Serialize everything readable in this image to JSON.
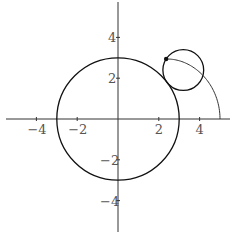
{
  "diagram": {
    "type": "epicycloid-construction",
    "fixed_circle": {
      "center": [
        0,
        0
      ],
      "radius": 3
    },
    "rolling_circle": {
      "center": [
        3.2,
        2.4
      ],
      "radius": 1
    },
    "tracing_point": [
      2.36,
      2.94
    ],
    "trace_start": [
      5,
      0
    ],
    "trace_param_end": 0.6435,
    "trace_equation": "x = 4cos(t) + cos(4t), y = 4sin(t) + sin(4t)"
  },
  "axes": {
    "x_ticks": [
      {
        "value": -4,
        "label": "-4"
      },
      {
        "value": -2,
        "label": "-2"
      },
      {
        "value": 2,
        "label": "2"
      },
      {
        "value": 4,
        "label": "4"
      }
    ],
    "y_ticks": [
      {
        "value": 4,
        "label": "4"
      },
      {
        "value": 2,
        "label": "2"
      },
      {
        "value": -2,
        "label": "-2"
      },
      {
        "value": -4,
        "label": "-4"
      }
    ]
  },
  "colors": {
    "stroke": "#111111",
    "axis": "#333333",
    "label": "#555555",
    "background": "#ffffff"
  }
}
